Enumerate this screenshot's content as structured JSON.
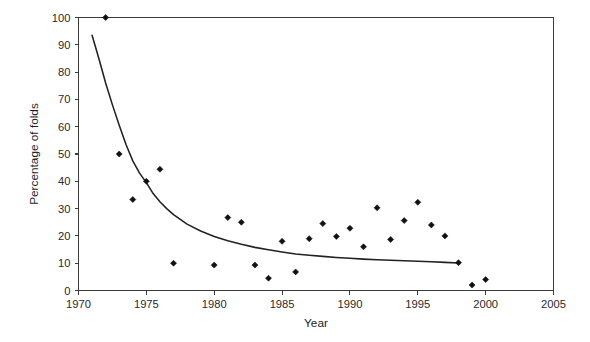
{
  "chart_data": {
    "type": "scatter",
    "title": "",
    "xlabel": "Year",
    "ylabel": "Percentage of folds",
    "xlim": [
      1970,
      2005
    ],
    "ylim": [
      0,
      100
    ],
    "xticks": [
      1970,
      1975,
      1980,
      1985,
      1990,
      1995,
      2000,
      2005
    ],
    "xtick_labels": [
      "1970",
      "1975",
      "1980",
      "1985",
      "1990",
      "1995",
      "2000",
      "2005"
    ],
    "yticks": [
      0,
      10,
      20,
      30,
      40,
      50,
      60,
      70,
      80,
      90,
      100
    ],
    "ytick_labels": [
      "0",
      "10",
      "20",
      "30",
      "40",
      "50",
      "60",
      "70",
      "80",
      "90",
      "100"
    ],
    "grid": false,
    "legend": false,
    "legend_position": "none",
    "marker": "diamond",
    "marker_color": "#111111",
    "curve_color": "#222222",
    "axis_color": "#3b3b3b",
    "background_color": "#ffffff",
    "x": [
      1972,
      1973,
      1974,
      1975,
      1976,
      1977,
      1980,
      1981,
      1982,
      1983,
      1984,
      1985,
      1986,
      1987,
      1988,
      1989,
      1990,
      1991,
      1992,
      1993,
      1994,
      1995,
      1996,
      1997,
      1998,
      1999,
      2000
    ],
    "values": [
      100,
      50,
      33.3,
      40,
      44.4,
      10,
      9.3,
      26.7,
      25,
      9.3,
      4.5,
      18,
      6.8,
      19,
      24.5,
      19.8,
      22.8,
      16,
      30.3,
      18.7,
      25.6,
      32.3,
      24,
      20,
      10.2,
      2,
      4
    ],
    "series": [
      {
        "name": "Percentage of folds",
        "type": "scatter",
        "points": [
          {
            "x": 1972,
            "y": 100
          },
          {
            "x": 1973,
            "y": 50
          },
          {
            "x": 1974,
            "y": 33.3
          },
          {
            "x": 1975,
            "y": 40
          },
          {
            "x": 1976,
            "y": 44.4
          },
          {
            "x": 1977,
            "y": 10
          },
          {
            "x": 1980,
            "y": 9.3
          },
          {
            "x": 1981,
            "y": 26.7
          },
          {
            "x": 1982,
            "y": 25
          },
          {
            "x": 1983,
            "y": 9.3
          },
          {
            "x": 1984,
            "y": 4.5
          },
          {
            "x": 1985,
            "y": 18
          },
          {
            "x": 1986,
            "y": 6.8
          },
          {
            "x": 1987,
            "y": 19
          },
          {
            "x": 1988,
            "y": 24.5
          },
          {
            "x": 1989,
            "y": 19.8
          },
          {
            "x": 1990,
            "y": 22.8
          },
          {
            "x": 1991,
            "y": 16
          },
          {
            "x": 1992,
            "y": 30.3
          },
          {
            "x": 1993,
            "y": 18.7
          },
          {
            "x": 1994,
            "y": 25.6
          },
          {
            "x": 1995,
            "y": 32.3
          },
          {
            "x": 1996,
            "y": 24
          },
          {
            "x": 1997,
            "y": 20
          },
          {
            "x": 1998,
            "y": 10.2
          },
          {
            "x": 1999,
            "y": 2
          },
          {
            "x": 2000,
            "y": 4
          }
        ]
      },
      {
        "name": "fitted decay curve",
        "type": "line",
        "points": [
          {
            "x": 1971.0,
            "y": 93.5
          },
          {
            "x": 1971.5,
            "y": 85.0
          },
          {
            "x": 1972.0,
            "y": 76.0
          },
          {
            "x": 1972.5,
            "y": 68.0
          },
          {
            "x": 1973.0,
            "y": 60.5
          },
          {
            "x": 1973.5,
            "y": 53.5
          },
          {
            "x": 1974.0,
            "y": 47.5
          },
          {
            "x": 1974.5,
            "y": 43.0
          },
          {
            "x": 1975.0,
            "y": 39.5
          },
          {
            "x": 1975.5,
            "y": 35.5
          },
          {
            "x": 1976.0,
            "y": 32.5
          },
          {
            "x": 1976.5,
            "y": 30.0
          },
          {
            "x": 1977.0,
            "y": 27.8
          },
          {
            "x": 1978.0,
            "y": 24.3
          },
          {
            "x": 1979.0,
            "y": 21.8
          },
          {
            "x": 1980.0,
            "y": 19.8
          },
          {
            "x": 1981.0,
            "y": 18.2
          },
          {
            "x": 1982.0,
            "y": 16.9
          },
          {
            "x": 1983.0,
            "y": 15.8
          },
          {
            "x": 1984.0,
            "y": 14.9
          },
          {
            "x": 1985.0,
            "y": 14.1
          },
          {
            "x": 1986.0,
            "y": 13.4
          },
          {
            "x": 1987.0,
            "y": 12.9
          },
          {
            "x": 1988.0,
            "y": 12.5
          },
          {
            "x": 1989.0,
            "y": 12.1
          },
          {
            "x": 1990.0,
            "y": 11.8
          },
          {
            "x": 1991.0,
            "y": 11.5
          },
          {
            "x": 1992.0,
            "y": 11.3
          },
          {
            "x": 1993.0,
            "y": 11.1
          },
          {
            "x": 1994.0,
            "y": 10.9
          },
          {
            "x": 1995.0,
            "y": 10.7
          },
          {
            "x": 1996.0,
            "y": 10.5
          },
          {
            "x": 1997.0,
            "y": 10.3
          },
          {
            "x": 1998.0,
            "y": 10.1
          }
        ]
      }
    ]
  }
}
